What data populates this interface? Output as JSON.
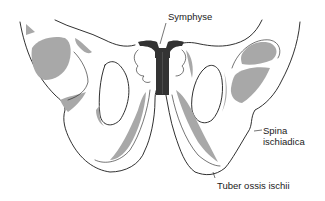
{
  "figure": {
    "colors": {
      "outline": "#1a1a1a",
      "shade": "#a8a8a8",
      "symphysis": "#333333",
      "background": "#ffffff"
    }
  },
  "labels": {
    "symphyse": "Symphyse",
    "spina_line1": "Spina",
    "spina_line2": "ischiadica",
    "tuber": "Tuber ossis ischii"
  }
}
